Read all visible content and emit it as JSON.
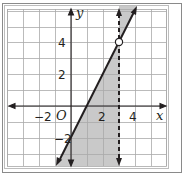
{
  "chart_data": {
    "type": "line",
    "title": "",
    "xlabel": "x",
    "ylabel": "y",
    "xlim": [
      -4,
      6
    ],
    "ylim": [
      -4,
      6
    ],
    "grid": true,
    "grid_step": 1,
    "x_tick_labels": [
      {
        "value": -2,
        "label": "−2"
      },
      {
        "value": 2,
        "label": "2"
      },
      {
        "value": 4,
        "label": "4"
      }
    ],
    "y_tick_labels": [
      {
        "value": 4,
        "label": "4"
      },
      {
        "value": 2,
        "label": "2"
      },
      {
        "value": -2,
        "label": "−2"
      }
    ],
    "origin_label": "O",
    "series": [
      {
        "name": "solid boundary line",
        "equation": "y = 2x - 2",
        "style": "solid",
        "points": [
          [
            -0.875,
            -3.75
          ],
          [
            4.15,
            6.3
          ]
        ]
      },
      {
        "name": "dashed boundary line",
        "equation": "x = 3",
        "style": "dashed",
        "points": [
          [
            3,
            -3.75
          ],
          [
            3,
            6.3
          ]
        ]
      }
    ],
    "annotations": [
      {
        "type": "open_circle",
        "x": 3,
        "y": 4
      }
    ],
    "shaded_regions": [
      {
        "description": "between solid line y=2x-2 and dashed line x=3, below intersection",
        "polygon": [
          [
            -0.875,
            -3.75
          ],
          [
            3,
            4
          ],
          [
            3,
            -3.75
          ]
        ]
      },
      {
        "description": "between dashed line x=3 and solid line y=2x-2, above intersection",
        "polygon": [
          [
            3,
            4
          ],
          [
            3,
            6.3
          ],
          [
            4.15,
            6.3
          ]
        ]
      }
    ],
    "colors": {
      "shade": "#c8c8c8",
      "line": "#231f20",
      "grid": "#a8a8a8"
    }
  }
}
